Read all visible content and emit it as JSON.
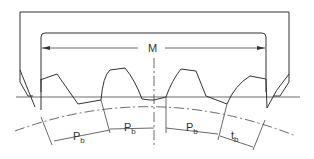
{
  "diagram": {
    "labels": {
      "span": "M",
      "pitch_1_main": "P",
      "pitch_1_sub": "b",
      "pitch_2_main": "P",
      "pitch_2_sub": "b",
      "pitch_3_main": "P",
      "pitch_3_sub": "b",
      "thickness_main": "t",
      "thickness_sub": "b"
    },
    "colors": {
      "line": "#333333",
      "background": "#ffffff"
    }
  }
}
